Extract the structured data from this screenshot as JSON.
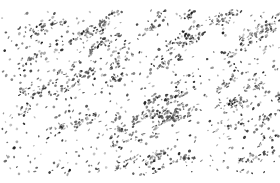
{
  "image": {
    "description": "Grayscale noise texture of scattered dark specks on a white background",
    "width": 280,
    "height": 183,
    "background": "#ffffff",
    "speck_colors": [
      "#1a1a1a",
      "#3a3a3a",
      "#5c5c5c",
      "#7d7d7d",
      "#a0a0a0"
    ],
    "margins": {
      "top": 10,
      "left": 2,
      "right": 0,
      "bottom": 8
    },
    "density": 1700,
    "seed": 20240611,
    "diagonal_bias": 0.55
  }
}
